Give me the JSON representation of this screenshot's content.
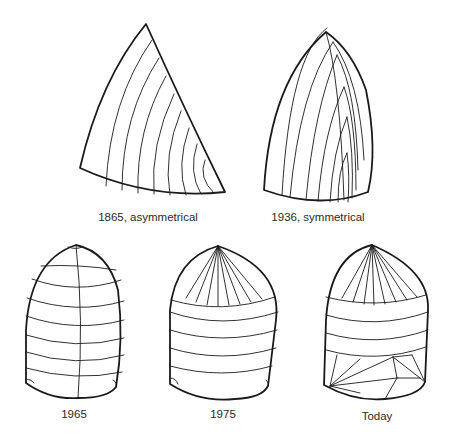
{
  "figure": {
    "sails": [
      {
        "id": "sail-1865",
        "label": "1865, asymmetrical",
        "type": "asymmetrical",
        "panel_style": "vertical curved panels"
      },
      {
        "id": "sail-1936",
        "label": "1936, symmetrical",
        "type": "symmetrical",
        "panel_style": "nested chevron panels"
      },
      {
        "id": "sail-1965",
        "label": "1965",
        "type": "symmetrical",
        "panel_style": "horizontal panels with center seam"
      },
      {
        "id": "sail-1975",
        "label": "1975",
        "type": "symmetrical",
        "panel_style": "radial head, horizontal body"
      },
      {
        "id": "sail-today",
        "label": "Today",
        "type": "symmetrical",
        "panel_style": "radial head, horizontal mid, radial foot"
      }
    ]
  }
}
